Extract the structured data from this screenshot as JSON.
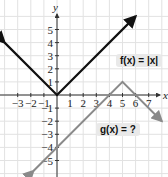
{
  "chart_data": {
    "type": "line",
    "title": "",
    "xlabel": "x",
    "ylabel": "y",
    "xlim": [
      -4,
      8
    ],
    "ylim": [
      -6,
      6
    ],
    "grid": true,
    "x_ticks": [
      "-3",
      "-2",
      "-1",
      "1",
      "2",
      "3",
      "4",
      "5",
      "6",
      "7"
    ],
    "y_ticks": [
      "5",
      "4",
      "3",
      "2",
      "1",
      "-1",
      "-2",
      "-3",
      "-4",
      "-5"
    ],
    "series": [
      {
        "name": "f(x) = |x|",
        "color": "#111111",
        "points": [
          [
            -4,
            4
          ],
          [
            0,
            0
          ],
          [
            6,
            6
          ]
        ]
      },
      {
        "name": "g(x) = ?",
        "color": "#8a8a8a",
        "points": [
          [
            -1.8,
            -5.8
          ],
          [
            5,
            1
          ],
          [
            8,
            -2
          ]
        ]
      }
    ],
    "annotations": [
      {
        "text": "f(x) = |x|",
        "x": 5.4,
        "y": 3.2
      },
      {
        "text": "g(x) = ?",
        "x": 4.2,
        "y": -2.2
      }
    ]
  },
  "labels": {
    "x_axis": "x",
    "y_axis": "y",
    "f_label": "f(x) = |x|",
    "g_label": "g(x) = ?"
  }
}
